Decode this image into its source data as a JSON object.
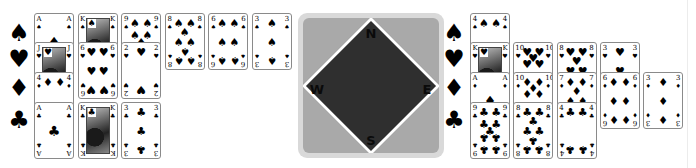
{
  "colors": {
    "background": "#ffffff",
    "card_border": "#8a8a8a",
    "panel_outer": "#d9d9d9",
    "panel_inner": "#a9a9a9",
    "diamond_fill": "#2f2f2f",
    "diamond_border": "#ffffff"
  },
  "suit_icons": {
    "spades": "♠",
    "hearts": "♥",
    "diamonds": "♦",
    "clubs": "♣"
  },
  "compass": {
    "north": "N",
    "east": "E",
    "south": "S",
    "west": "W"
  },
  "west_hand": {
    "rows": [
      {
        "suit": "spades",
        "cards": [
          "A",
          "K",
          "9",
          "8",
          "6",
          "3"
        ]
      },
      {
        "suit": "hearts",
        "cards": [
          "J",
          "6",
          "2"
        ]
      },
      {
        "suit": "diamonds",
        "cards": [
          "4"
        ]
      },
      {
        "suit": "clubs",
        "cards": [
          "A",
          "K",
          "3"
        ]
      }
    ]
  },
  "east_hand": {
    "rows": [
      {
        "suit": "spades",
        "cards": [
          "4"
        ]
      },
      {
        "suit": "hearts",
        "cards": [
          "K",
          "10",
          "8",
          "3"
        ]
      },
      {
        "suit": "diamonds",
        "cards": [
          "A",
          "10",
          "7",
          "6",
          "3"
        ]
      },
      {
        "suit": "clubs",
        "cards": [
          "9",
          "8",
          "4"
        ]
      }
    ]
  }
}
